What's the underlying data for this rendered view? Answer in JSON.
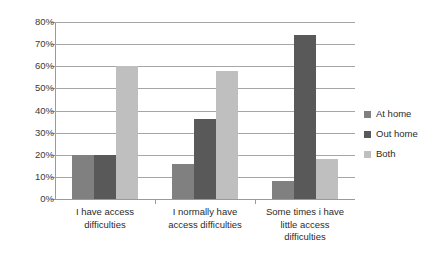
{
  "chart_data": {
    "type": "bar",
    "title": "",
    "subtitle": "",
    "xlabel": "",
    "ylabel": "",
    "ylim": [
      0,
      80
    ],
    "y_tick_step": 10,
    "y_ticks": [
      "0%",
      "10%",
      "20%",
      "30%",
      "40%",
      "50%",
      "60%",
      "70%",
      "80%"
    ],
    "y_tick_values": [
      0,
      10,
      20,
      30,
      40,
      50,
      60,
      70,
      80
    ],
    "grid": true,
    "grid_axis": "y",
    "legend_position": "right",
    "value_suffix": "%",
    "categories": [
      "I have access difficulties",
      "I normally have access difficulties",
      "Some times i have little access difficulties"
    ],
    "category_lines": [
      [
        "I have access",
        "difficulties"
      ],
      [
        "I normally have",
        "access difficulties"
      ],
      [
        "Some times i have",
        "little access",
        "difficulties"
      ]
    ],
    "series": [
      {
        "name": "At home",
        "color": "#808080",
        "values": [
          20,
          16,
          8
        ]
      },
      {
        "name": "Out home",
        "color": "#595959",
        "values": [
          20,
          36,
          74
        ]
      },
      {
        "name": "Both",
        "color": "#bfbfbf",
        "values": [
          60,
          58,
          18
        ]
      }
    ]
  },
  "legend": {
    "items": [
      {
        "label": "At home",
        "color": "#808080"
      },
      {
        "label": "Out home",
        "color": "#595959"
      },
      {
        "label": "Both",
        "color": "#bfbfbf"
      }
    ]
  }
}
